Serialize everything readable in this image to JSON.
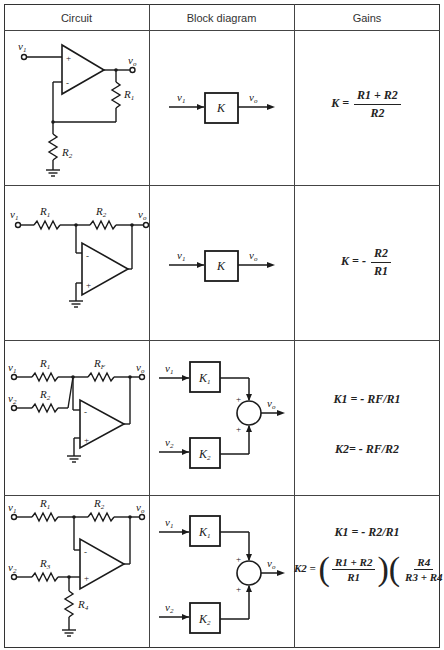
{
  "header": {
    "columns": [
      "Circuit",
      "Block diagram",
      "Gains"
    ]
  },
  "rows": [
    {
      "circuit": {
        "type": "non-inverting amplifier",
        "labels": {
          "in1": "v1",
          "out": "vo",
          "r_a": "R1",
          "r_b": "R2",
          "plus": "+",
          "minus": "-"
        }
      },
      "block": {
        "in1": "v1",
        "out": "vo",
        "block": "K"
      },
      "gains": {
        "lhs": "K =",
        "num": "R1 + R2",
        "den": "R2"
      }
    },
    {
      "circuit": {
        "type": "inverting amplifier",
        "labels": {
          "in1": "v1",
          "out": "vo",
          "r_a": "R1",
          "r_b": "R2",
          "plus": "+",
          "minus": "-"
        }
      },
      "block": {
        "in1": "v1",
        "out": "vo",
        "block": "K"
      },
      "gains": {
        "lhs": "K = -",
        "num": "R2",
        "den": "R1"
      }
    },
    {
      "circuit": {
        "type": "inverting summer",
        "labels": {
          "in1": "v1",
          "in2": "v2",
          "out": "vo",
          "r_a": "R1",
          "r_b": "R2",
          "r_f": "RF",
          "plus": "+",
          "minus": "-"
        }
      },
      "block": {
        "in1": "v1",
        "in2": "v2",
        "out": "vo",
        "block1": "K1",
        "block2": "K2",
        "sum_plus": "+"
      },
      "gains": {
        "k1": "K1 = - RF/R1",
        "k2": "K2= - RF/R2"
      }
    },
    {
      "circuit": {
        "type": "difference amplifier",
        "labels": {
          "in1": "v1",
          "in2": "v2",
          "out": "vo",
          "r_a": "R1",
          "r_b": "R2",
          "r_c": "R3",
          "r_d": "R4",
          "plus": "+",
          "minus": "-"
        }
      },
      "block": {
        "in1": "v1",
        "in2": "v2",
        "out": "vo",
        "block1": "K1",
        "block2": "K2",
        "sum_plus": "+"
      },
      "gains": {
        "k1": "K1 = - R2/R1",
        "k2_lhs": "K2 =",
        "k2_f1_num": "R1 + R2",
        "k2_f1_den": "R1",
        "k2_f2_num": "R4",
        "k2_f2_den": "R3 + R4"
      }
    }
  ]
}
